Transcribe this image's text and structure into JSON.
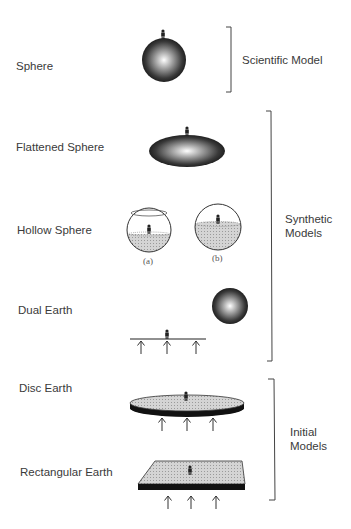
{
  "diagram": {
    "models": [
      {
        "label": "Sphere",
        "shape": "shaded-sphere-with-person"
      },
      {
        "label": "Flattened Sphere",
        "shape": "shaded-ellipsoid-with-person"
      },
      {
        "label": "Hollow Sphere",
        "shape": "hollow-spheres-with-person-inside",
        "variants": [
          "(a)",
          "(b)"
        ]
      },
      {
        "label": "Dual Earth",
        "shape": "flat-ground-with-supports-plus-sphere"
      },
      {
        "label": "Disc Earth",
        "shape": "disc-with-supports"
      },
      {
        "label": "Rectangular Earth",
        "shape": "rectangle-with-supports"
      }
    ],
    "groups": [
      {
        "label": "Scientific Model",
        "line1": "Scientific Model",
        "members": [
          "Sphere"
        ]
      },
      {
        "label": "Synthetic Models",
        "line1": "Synthetic",
        "line2": "Models",
        "members": [
          "Flattened Sphere",
          "Hollow Sphere",
          "Dual Earth"
        ]
      },
      {
        "label": "Initial Models",
        "line1": "Initial",
        "line2": "Models",
        "members": [
          "Disc Earth",
          "Rectangular Earth"
        ]
      }
    ]
  }
}
